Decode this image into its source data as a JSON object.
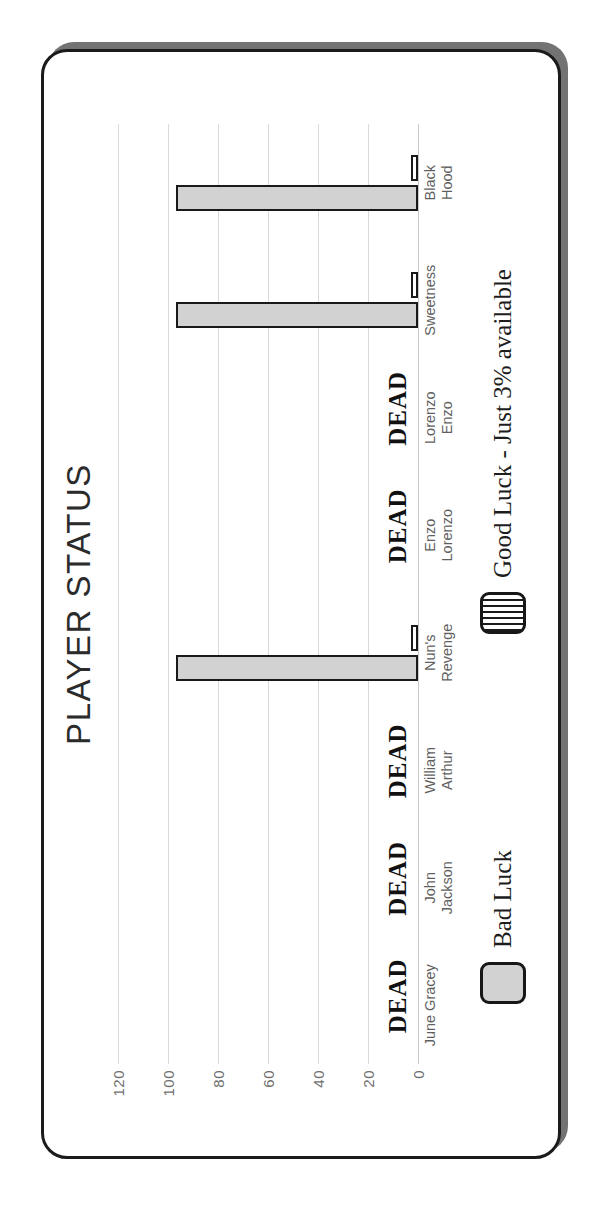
{
  "chart_data": {
    "type": "bar",
    "title": "PLAYER STATUS",
    "xlabel": "",
    "ylabel": "",
    "ylim": [
      0,
      120
    ],
    "yticks": [
      "0",
      "20",
      "40",
      "60",
      "80",
      "100",
      "120"
    ],
    "grid": true,
    "legend_position": "bottom",
    "categories": [
      "June Gracey",
      "John\nJackson",
      "William\nArthur",
      "Nun's\nRevenge",
      "Enzo\nLorenzo",
      "Lorenzo\nEnzo",
      "Sweetness",
      "Black\nHood"
    ],
    "series": [
      {
        "name": "Bad Luck",
        "color": "#d2d2d2",
        "values": [
          0,
          0,
          0,
          97,
          0,
          0,
          97,
          97
        ]
      },
      {
        "name": "Good Luck - Just 3% available",
        "color": "#ffffff",
        "values": [
          0,
          0,
          0,
          3,
          0,
          0,
          3,
          3
        ]
      }
    ],
    "annotations": [
      {
        "category": "June Gracey",
        "text": "DEAD"
      },
      {
        "category": "John\nJackson",
        "text": "DEAD"
      },
      {
        "category": "William\nArthur",
        "text": "DEAD"
      },
      {
        "category": "Enzo\nLorenzo",
        "text": "DEAD"
      },
      {
        "category": "Lorenzo\nEnzo",
        "text": "DEAD"
      }
    ]
  },
  "card": {
    "title": "PLAYER STATUS"
  },
  "legend": {
    "items": [
      {
        "label": "Bad Luck",
        "swatch": "bad-luck-swatch"
      },
      {
        "label": "Good Luck - Just 3% available",
        "swatch": "good-luck-swatch"
      }
    ]
  },
  "colors": {
    "bar_bad": "#d2d2d2",
    "bar_good": "#ffffff",
    "bar_outline": "#1a1a1a",
    "grid": "#d9d9d9",
    "tick_text": "#6f6f6f",
    "category_text": "#5f5f5f",
    "title_text": "#2b2b2b",
    "card_border": "#1b1b1b",
    "card_shadow": "#5a5a5a",
    "background": "#ffffff"
  }
}
